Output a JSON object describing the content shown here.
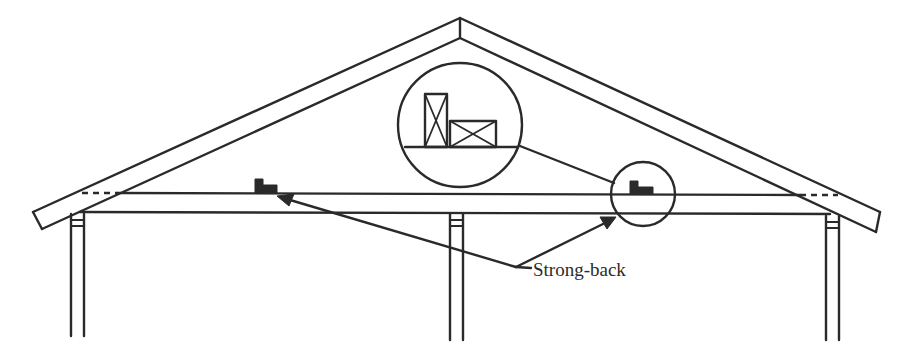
{
  "diagram": {
    "type": "roof-truss-cross-section",
    "labels": {
      "strong_back": "Strong-back"
    },
    "components": [
      "roof-rafters",
      "ceiling-joist",
      "strong-back-left",
      "strong-back-right",
      "detail-callout-circle",
      "detail-magnified-circle",
      "support-posts"
    ],
    "colors": {
      "ink": "#2a2a2a",
      "background": "#ffffff"
    }
  }
}
